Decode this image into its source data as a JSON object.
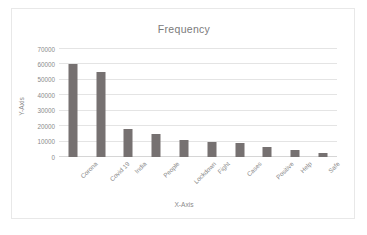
{
  "chart_data": {
    "type": "bar",
    "title": "Frequency",
    "xlabel": "X-Axis",
    "ylabel": "Y-Axis",
    "categories": [
      "Corona",
      "Covid 19",
      "India",
      "People",
      "Lockdown",
      "Fight",
      "Cases",
      "Positive",
      "Help",
      "Safe"
    ],
    "values": [
      60000,
      55000,
      18000,
      15000,
      11000,
      10000,
      9000,
      6500,
      4500,
      2500
    ],
    "ylim": [
      0,
      70000
    ],
    "yticks": [
      0,
      10000,
      20000,
      30000,
      40000,
      50000,
      60000,
      70000
    ],
    "ytick_labels": [
      "0",
      "10000",
      "20000",
      "30000",
      "40000",
      "50000",
      "60000",
      "70000"
    ],
    "grid": true,
    "legend": false,
    "bar_color": "#767171",
    "gridline_color": "#e4e4e4",
    "text_color": "#8a8a8a",
    "background": "#ffffff",
    "border_color": "#e8e8e8"
  }
}
